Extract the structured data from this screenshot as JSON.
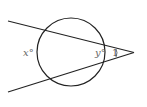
{
  "diagram": {
    "type": "geometry",
    "labels": {
      "far_arc": "x°",
      "near_arc": "y°",
      "vertex_angle": "1"
    },
    "colors": {
      "stroke": "#222222",
      "label": "#666666",
      "background": "#ffffff"
    }
  }
}
